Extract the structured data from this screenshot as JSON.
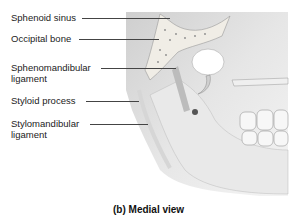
{
  "figure": {
    "caption": "(b) Medial view",
    "labels": [
      {
        "id": "sphenoid-sinus",
        "line1": "Sphenoid sinus",
        "line2": ""
      },
      {
        "id": "occipital-bone",
        "line1": "Occipital bone",
        "line2": ""
      },
      {
        "id": "sphenomandibular-ligament",
        "line1": "Sphenomandibular",
        "line2": "ligament"
      },
      {
        "id": "styloid-process",
        "line1": "Styloid process",
        "line2": ""
      },
      {
        "id": "stylomandibular-ligament",
        "line1": "Stylomandibular",
        "line2": "ligament"
      }
    ],
    "colors": {
      "bone": "#d9d9d9",
      "shadow": "#9a9a9a",
      "light": "#f2f2f2",
      "line": "#444444"
    }
  }
}
